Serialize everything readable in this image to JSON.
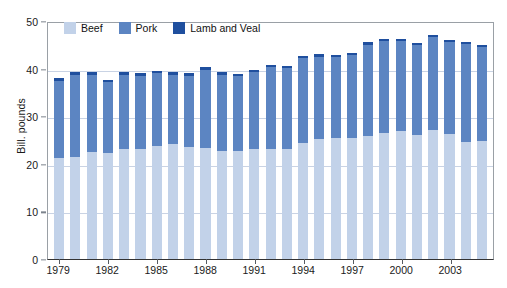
{
  "chart_data": {
    "type": "bar",
    "stacked": true,
    "title": "",
    "subtitle": "",
    "xlabel": "",
    "ylabel": "Bill. pounds",
    "ylim": [
      0,
      50
    ],
    "yticks": [
      0,
      10,
      20,
      30,
      40,
      50
    ],
    "grid": true,
    "legend_position": "top-left-inside",
    "categories": [
      "1979",
      "1980",
      "1981",
      "1982",
      "1983",
      "1984",
      "1985",
      "1986",
      "1987",
      "1988",
      "1989",
      "1990",
      "1991",
      "1992",
      "1993",
      "1994",
      "1995",
      "1996",
      "1997",
      "1998",
      "1999",
      "2000",
      "2001",
      "2002",
      "2003",
      "2004",
      "2005"
    ],
    "xtick_labels": [
      "1979",
      "1982",
      "1985",
      "1988",
      "1991",
      "1994",
      "1997",
      "2000",
      "2003"
    ],
    "series": [
      {
        "name": "Beef",
        "color": "#c2d2e9",
        "values": [
          21.3,
          21.4,
          22.4,
          22.3,
          23.2,
          23.2,
          23.7,
          24.2,
          23.5,
          23.4,
          22.6,
          22.7,
          23.1,
          23.1,
          23.1,
          24.3,
          25.2,
          25.5,
          25.5,
          25.8,
          26.5,
          26.9,
          26.1,
          27.1,
          26.3,
          24.6,
          24.7
        ]
      },
      {
        "name": "Pork",
        "color": "#5c85c2",
        "values": [
          16.0,
          17.3,
          16.3,
          14.8,
          15.5,
          15.2,
          15.3,
          14.4,
          15.0,
          16.4,
          16.1,
          15.7,
          16.2,
          17.2,
          17.0,
          17.9,
          17.3,
          16.9,
          17.3,
          19.2,
          19.3,
          18.9,
          18.8,
          19.5,
          19.3,
          20.5,
          19.8
        ]
      },
      {
        "name": "Lamb and Veal",
        "color": "#1f4f9e",
        "values": [
          0.7,
          0.6,
          0.6,
          0.6,
          0.6,
          0.6,
          0.6,
          0.6,
          0.6,
          0.5,
          0.5,
          0.5,
          0.5,
          0.5,
          0.5,
          0.5,
          0.5,
          0.5,
          0.5,
          0.5,
          0.4,
          0.4,
          0.4,
          0.4,
          0.4,
          0.4,
          0.4
        ]
      }
    ],
    "totals": [
      38.0,
      39.3,
      39.3,
      37.7,
      39.3,
      39.0,
      39.6,
      39.2,
      39.1,
      40.3,
      39.2,
      38.9,
      39.8,
      40.8,
      40.6,
      42.7,
      43.0,
      42.9,
      43.3,
      45.5,
      46.2,
      46.2,
      45.3,
      47.0,
      46.0,
      45.5,
      44.9
    ]
  },
  "legend": {
    "items": [
      {
        "label": "Beef",
        "color": "#c2d2e9"
      },
      {
        "label": "Pork",
        "color": "#5c85c2"
      },
      {
        "label": "Lamb and Veal",
        "color": "#1f4f9e"
      }
    ]
  },
  "axis": {
    "y_title": "Bill. pounds"
  }
}
